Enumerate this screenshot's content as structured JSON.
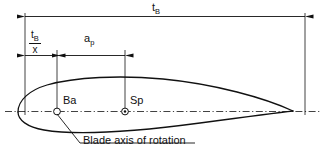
{
  "figure": {
    "type": "engineering-diagram",
    "background_color": "#ffffff",
    "line_color": "#111111"
  },
  "dimensions": {
    "chord": {
      "symbol_base": "t",
      "symbol_sub": "B",
      "description": "overall blade chord length"
    },
    "leading_fraction": {
      "numerator_base": "t",
      "numerator_sub": "B",
      "denominator": "x",
      "description": "distance from leading edge to blade axis of rotation"
    },
    "offset": {
      "symbol_base": "a",
      "symbol_sub": "p",
      "description": "distance from blade axis of rotation to centre of pressure"
    }
  },
  "points": {
    "ba": {
      "label": "Ba",
      "marker": "circle-marker",
      "description": "blade axis of rotation"
    },
    "sp": {
      "label": "Sp",
      "marker": "circle-dot-marker",
      "description": "centre of pressure"
    }
  },
  "caption": {
    "text": "Blade axis of rotation"
  }
}
